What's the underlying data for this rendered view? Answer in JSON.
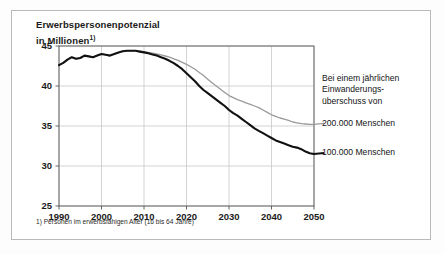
{
  "chart_data": {
    "type": "line",
    "title_line1": "Erwerbspersonenpotenzial",
    "title_line2": "in Millionen",
    "title_footnote_marker": "1)",
    "xlabel": "",
    "ylabel": "",
    "xlim": [
      1990,
      2050
    ],
    "ylim": [
      25,
      45
    ],
    "yticks": [
      25,
      30,
      35,
      40,
      45
    ],
    "xticks": [
      1990,
      2000,
      2010,
      2020,
      2030,
      2040,
      2050
    ],
    "grid": true,
    "legend_position": "right",
    "legend_header": "Bei einem jährlichen Einwanderungs-überschuss von",
    "legend_header_line1": "Bei einem jährlichen",
    "legend_header_line2": "Einwanderungs-",
    "legend_header_line3": "überschuss von",
    "footnote": "1) Personen im erwerbsfähigen Alter (16 bis 64 Jahre)",
    "colors": {
      "series_200k": "#9a9a9a",
      "series_100k": "#111111",
      "grid": "#c8c8c8",
      "axis": "#555555"
    },
    "x": [
      1990,
      1991,
      1992,
      1993,
      1994,
      1995,
      1996,
      1997,
      1998,
      1999,
      2000,
      2001,
      2002,
      2003,
      2004,
      2005,
      2006,
      2007,
      2008,
      2009,
      2010,
      2011,
      2012,
      2013,
      2014,
      2015,
      2016,
      2017,
      2018,
      2019,
      2020,
      2021,
      2022,
      2023,
      2024,
      2025,
      2026,
      2027,
      2028,
      2029,
      2030,
      2031,
      2032,
      2033,
      2034,
      2035,
      2036,
      2037,
      2038,
      2039,
      2040,
      2041,
      2042,
      2043,
      2044,
      2045,
      2046,
      2047,
      2048,
      2049,
      2050
    ],
    "series": [
      {
        "name": "200.000 Menschen",
        "label": "200.000 Menschen",
        "color": "#9a9a9a",
        "values": [
          42.6,
          42.9,
          43.3,
          43.6,
          43.4,
          43.5,
          43.8,
          43.7,
          43.6,
          43.8,
          44.0,
          43.9,
          43.8,
          44.0,
          44.2,
          44.35,
          44.4,
          44.4,
          44.4,
          44.35,
          44.3,
          44.2,
          44.1,
          44.0,
          43.9,
          43.75,
          43.6,
          43.4,
          43.2,
          42.95,
          42.7,
          42.4,
          42.1,
          41.7,
          41.3,
          40.85,
          40.4,
          40.0,
          39.6,
          39.2,
          38.8,
          38.55,
          38.3,
          38.1,
          37.9,
          37.7,
          37.5,
          37.3,
          37.0,
          36.7,
          36.4,
          36.2,
          36.0,
          35.85,
          35.7,
          35.5,
          35.4,
          35.3,
          35.25,
          35.2,
          35.2
        ]
      },
      {
        "name": "100.000 Menschen",
        "label": "100.000 Menschen",
        "color": "#111111",
        "values": [
          42.6,
          42.9,
          43.3,
          43.6,
          43.4,
          43.5,
          43.8,
          43.7,
          43.6,
          43.8,
          44.0,
          43.9,
          43.8,
          44.0,
          44.2,
          44.35,
          44.4,
          44.4,
          44.4,
          44.3,
          44.2,
          44.1,
          43.95,
          43.8,
          43.6,
          43.4,
          43.15,
          42.85,
          42.5,
          42.1,
          41.6,
          41.1,
          40.6,
          40.0,
          39.5,
          39.1,
          38.7,
          38.3,
          37.9,
          37.5,
          37.0,
          36.6,
          36.3,
          35.9,
          35.5,
          35.1,
          34.7,
          34.4,
          34.1,
          33.8,
          33.5,
          33.2,
          33.0,
          32.8,
          32.6,
          32.4,
          32.3,
          32.1,
          31.8,
          31.6,
          31.5
        ]
      }
    ]
  }
}
